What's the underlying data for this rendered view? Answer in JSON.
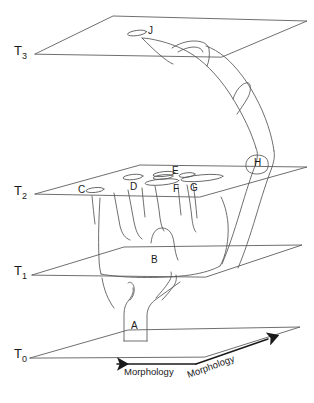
{
  "figure": {
    "type": "phylogenetic-time-slice-diagram",
    "background_color": "#ffffff",
    "line_color": "#4d4d4d",
    "text_color": "#1a1a1a"
  },
  "time_planes": [
    {
      "id": "T3",
      "label": "T",
      "subscript": "3",
      "label_x": 14,
      "label_y": 45
    },
    {
      "id": "T2",
      "label": "T",
      "subscript": "2",
      "label_x": 14,
      "label_y": 185
    },
    {
      "id": "T1",
      "label": "T",
      "subscript": "1",
      "label_x": 14,
      "label_y": 265
    },
    {
      "id": "T0",
      "label": "T",
      "subscript": "0",
      "label_x": 14,
      "label_y": 348
    }
  ],
  "node_labels": [
    {
      "id": "J",
      "text": "J",
      "x": 146,
      "y": 31,
      "plane": "T3"
    },
    {
      "id": "C",
      "text": "C",
      "x": 77,
      "y": 186,
      "plane": "T2"
    },
    {
      "id": "D",
      "text": "D",
      "x": 130,
      "y": 183,
      "plane": "T2"
    },
    {
      "id": "E",
      "text": "E",
      "x": 173,
      "y": 170,
      "plane": "T2"
    },
    {
      "id": "F",
      "text": "F",
      "x": 175,
      "y": 187,
      "plane": "T2"
    },
    {
      "id": "G",
      "text": "G",
      "x": 191,
      "y": 186,
      "plane": "T2"
    },
    {
      "id": "H",
      "text": "H",
      "x": 255,
      "y": 161,
      "plane": "T2"
    },
    {
      "id": "B",
      "text": "B",
      "x": 152,
      "y": 258,
      "plane": "between-T1-T2"
    },
    {
      "id": "A",
      "text": "A",
      "x": 131,
      "y": 325,
      "plane": "T0"
    }
  ],
  "axis": {
    "left_label": "Morphology",
    "right_label": "Morphology",
    "left_label_x": 127,
    "left_label_y": 372,
    "right_label_x": 192,
    "right_label_y": 376,
    "right_label_rotation": -22
  }
}
